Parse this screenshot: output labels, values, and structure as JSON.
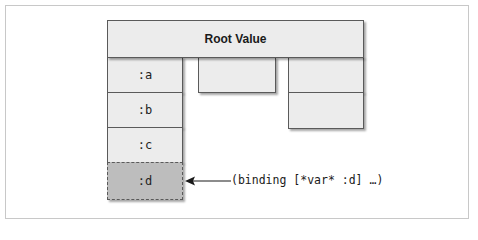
{
  "diagram": {
    "root": {
      "label": "Root Value"
    },
    "left_column": {
      "cells": [
        {
          "label": ":a"
        },
        {
          "label": ":b"
        },
        {
          "label": ":c"
        },
        {
          "label": ":d",
          "highlighted": true
        }
      ]
    },
    "middle_column": {
      "cells": [
        {
          "label": ""
        }
      ]
    },
    "right_column": {
      "cells": [
        {
          "label": ""
        },
        {
          "label": ""
        }
      ]
    },
    "annotation": {
      "text": "(binding [*var* :d] …)",
      "points_to": ":d"
    },
    "colors": {
      "box_fill": "#ececec",
      "highlight_fill": "#bdbdbd",
      "border": "#5a5a5a",
      "frame_border": "#c8c8c8"
    }
  }
}
